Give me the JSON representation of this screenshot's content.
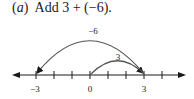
{
  "problem": {
    "label": "(a)",
    "label_letter": "a",
    "text": "Add 3 + (−6)."
  },
  "number_line": {
    "min_tick": -3,
    "max_tick": 4,
    "labeled_ticks": [
      {
        "value": -3,
        "label": "−3"
      },
      {
        "value": 0,
        "label": "0"
      },
      {
        "value": 3,
        "label": "3"
      }
    ],
    "arcs": [
      {
        "from": 0,
        "to": 3,
        "label": "3"
      },
      {
        "from": 3,
        "to": -3,
        "label": "−6"
      }
    ]
  }
}
